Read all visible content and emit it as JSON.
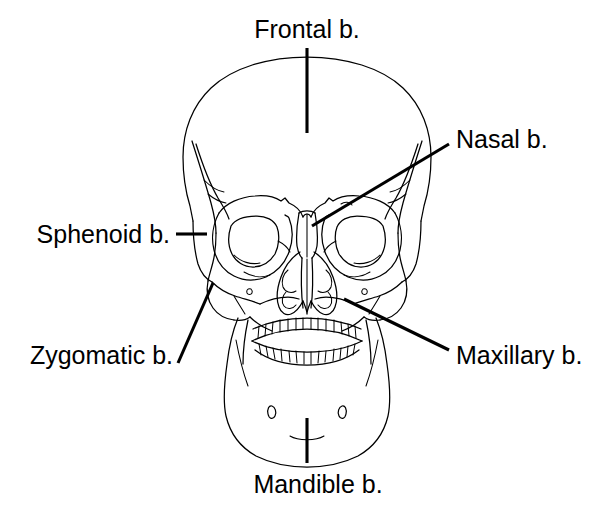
{
  "figure": {
    "background_color": "#ffffff",
    "line_color": "#000000",
    "width": 595,
    "height": 505
  },
  "labels": {
    "frontal": {
      "text": "Frontal b.",
      "x": 307,
      "y": 38,
      "anchor": "middle"
    },
    "nasal": {
      "text": "Nasal b.",
      "x": 456,
      "y": 148,
      "anchor": "start"
    },
    "sphenoid": {
      "text": "Sphenoid b.",
      "x": 170,
      "y": 243,
      "anchor": "end"
    },
    "zygomatic": {
      "text": "Zygomatic b.",
      "x": 173,
      "y": 364,
      "anchor": "end"
    },
    "maxillary": {
      "text": "Maxillary b.",
      "x": 456,
      "y": 364,
      "anchor": "start"
    },
    "mandible": {
      "text": "Mandible b.",
      "x": 318,
      "y": 493,
      "anchor": "middle"
    }
  },
  "leader_lines": {
    "frontal": {
      "x1": 307,
      "y1": 48,
      "x2": 307,
      "y2": 133
    },
    "nasal": {
      "x1": 449,
      "y1": 144,
      "x2": 312,
      "y2": 226
    },
    "sphenoid": {
      "x1": 176,
      "y1": 234,
      "x2": 207,
      "y2": 234
    },
    "zygomatic": {
      "x1": 178,
      "y1": 363,
      "x2": 213,
      "y2": 283
    },
    "maxillary": {
      "x1": 449,
      "y1": 350,
      "x2": 344,
      "y2": 299
    },
    "mandible": {
      "x1": 307,
      "y1": 418,
      "x2": 307,
      "y2": 463
    }
  },
  "bones": [
    "Frontal b.",
    "Nasal b.",
    "Sphenoid b.",
    "Zygomatic b.",
    "Maxillary b.",
    "Mandible b."
  ]
}
